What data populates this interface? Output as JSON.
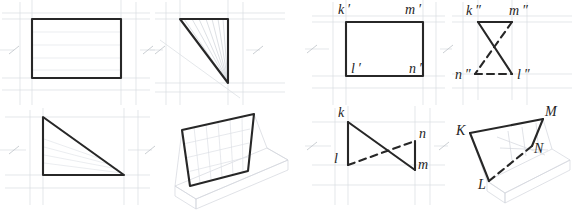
{
  "figure": {
    "background_color": "#ffffff",
    "stroke_dark": "#272727",
    "stroke_faint": "#d6d9de",
    "stroke_mid_faint": "#c2c6cc",
    "label_color": "#1e1e1e",
    "heavy_line_width": 2.1,
    "faint_line_width": 0.7,
    "dash_pattern": "7 5"
  },
  "panels": [
    {
      "id": "panel-1",
      "name": "front-view-rectangle",
      "caption": "",
      "shape": "rectangle",
      "description": "True-shape rectangle with horizontal ruling lines"
    },
    {
      "id": "panel-2",
      "name": "edge-view-triangle-fan",
      "caption": "",
      "shape": "right-triangle",
      "description": "Right triangle with fan of rays from lower vertex"
    },
    {
      "id": "panel-3",
      "name": "top-view-triangle",
      "caption": "",
      "shape": "right-triangle",
      "description": "Right triangle, vertical left leg and horizontal base"
    },
    {
      "id": "panel-4",
      "name": "axonometric-plane-on-box",
      "caption": "",
      "shape": "quadrilateral",
      "description": "Tilted gridded plane standing on a faint pictorial box"
    },
    {
      "id": "panel-5",
      "name": "frontal-projection-klmn",
      "caption": "",
      "shape": "rectangle",
      "description": "Frontal projection k' l' m' n' as a rectangle"
    },
    {
      "id": "panel-6",
      "name": "profile-projection-klmn",
      "caption": "",
      "shape": "bowtie",
      "description": "Profile projection k\" m\" n\" l\" crossing bowtie"
    },
    {
      "id": "panel-7",
      "name": "horizontal-projection-klmn",
      "caption": "",
      "shape": "bowtie",
      "description": "Horizontal projection k l n m crossing bowtie"
    },
    {
      "id": "panel-8",
      "name": "pictorial-plane-klmn",
      "caption": "",
      "shape": "quadrilateral",
      "description": "Pictorial view of plane K L M N on a faint box"
    }
  ],
  "labels": {
    "frontal": [
      {
        "name": "label-k-prime",
        "text": "k ′",
        "x": 338,
        "y": 5,
        "size": 14
      },
      {
        "name": "label-m-prime",
        "text": "m ′",
        "x": 407,
        "y": 5,
        "size": 14
      },
      {
        "name": "label-l-prime",
        "text": "l ′",
        "x": 341,
        "y": 68,
        "size": 14
      },
      {
        "name": "label-n-prime",
        "text": "n ′",
        "x": 411,
        "y": 68,
        "size": 14
      }
    ],
    "profile": [
      {
        "name": "label-k-dprime",
        "text": "k ″",
        "x": 467,
        "y": 6,
        "size": 14
      },
      {
        "name": "label-m-dprime",
        "text": "m ″",
        "x": 511,
        "y": 6,
        "size": 14
      },
      {
        "name": "label-n-dprime",
        "text": "n ″",
        "x": 457,
        "y": 71,
        "size": 14
      },
      {
        "name": "label-l-dprime",
        "text": "l ″",
        "x": 516,
        "y": 71,
        "size": 14
      }
    ],
    "horizontal": [
      {
        "name": "label-k",
        "text": "k",
        "x": 336,
        "y": 113,
        "size": 14
      },
      {
        "name": "label-n",
        "text": "n",
        "x": 419,
        "y": 133,
        "size": 14
      },
      {
        "name": "label-l",
        "text": "l",
        "x": 332,
        "y": 152,
        "size": 14
      },
      {
        "name": "label-m",
        "text": "m",
        "x": 423,
        "y": 160,
        "size": 14
      }
    ],
    "pictorial": [
      {
        "name": "label-K-upper",
        "text": "K",
        "x": 457,
        "y": 133,
        "size": 14
      },
      {
        "name": "label-M-upper",
        "text": "M",
        "x": 545,
        "y": 114,
        "size": 14
      },
      {
        "name": "label-N-upper",
        "text": "N",
        "x": 532,
        "y": 150,
        "size": 14
      },
      {
        "name": "label-L-upper",
        "text": "L",
        "x": 478,
        "y": 185,
        "size": 14
      }
    ]
  },
  "geometry": {
    "panel1_rect": {
      "x": 32,
      "y": 19,
      "w": 89,
      "h": 59
    },
    "panel2_triangle": "228,19 228,83 180,19",
    "panel3_triangle": "43,117 43,175 124,175",
    "panel4_plane": "182,130 254,114 248,171 190,186",
    "panel5_rect": {
      "x": 346,
      "y": 22,
      "w": 77,
      "h": 54
    },
    "panel6_bowtie": {
      "k": "478,22",
      "m": "512,22",
      "n": "475,74",
      "l": "512,74"
    },
    "panel7_bowtie": {
      "k": "348,122",
      "l": "348,165",
      "n": "415,141",
      "m": "415,170"
    },
    "panel8_plane": {
      "K": "470,133",
      "M": "543,119",
      "N": "532,146",
      "L": "489,181"
    }
  }
}
